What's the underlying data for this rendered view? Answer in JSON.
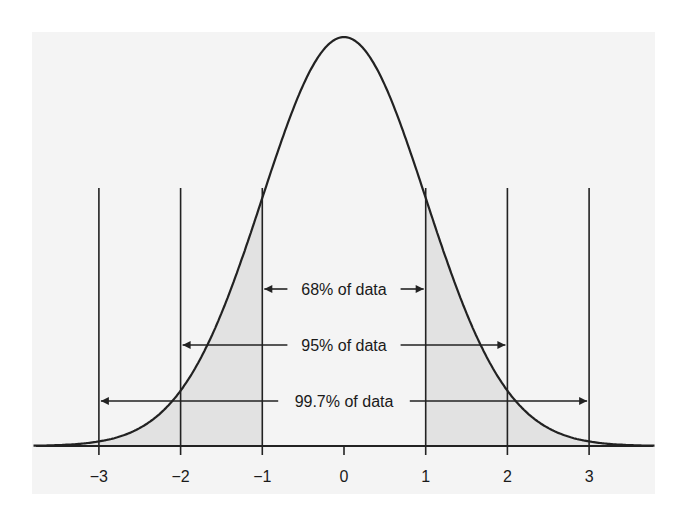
{
  "chart_data": {
    "type": "area",
    "title": "",
    "xlabel": "",
    "ylabel": "",
    "distribution": "standard normal",
    "x_ticks": [
      -3,
      -2,
      -1,
      0,
      1,
      2,
      3
    ],
    "x_tick_labels": [
      "−3",
      "−2",
      "−1",
      "0",
      "1",
      "2",
      "3"
    ],
    "xlim": [
      -3.8,
      3.8
    ],
    "mean": 0,
    "sd": 1,
    "shaded_regions": [
      {
        "from": -3.8,
        "to": -1
      },
      {
        "from": 1,
        "to": 3.8
      }
    ],
    "vertical_lines": [
      -3,
      -2,
      -1,
      1,
      2,
      3
    ],
    "annotations": [
      {
        "label": "68% of data",
        "from": -1,
        "to": 1
      },
      {
        "label": "95% of data",
        "from": -2,
        "to": 2
      },
      {
        "label": "99.7% of data",
        "from": -3,
        "to": 3
      }
    ],
    "grid": false,
    "legend": null
  },
  "colors": {
    "panel": "#f4f4f4",
    "shade": "#e2e2e2",
    "line": "#222222"
  }
}
